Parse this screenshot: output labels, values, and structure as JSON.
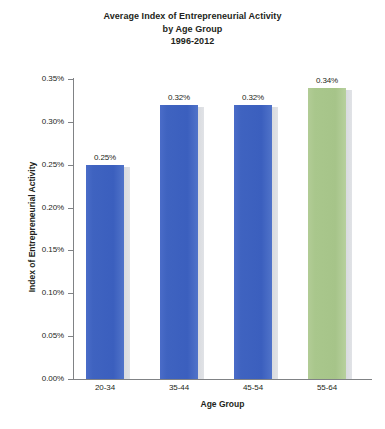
{
  "chart_data": {
    "type": "bar",
    "title": "Average Index of Entrepreneurial Activity by Age Group 1996-2012",
    "title_lines": [
      "Average Index of Entrepreneurial Activity",
      "by Age Group",
      "1996-2012"
    ],
    "xlabel": "Age Group",
    "ylabel": "Index of Entrepreneurial Activity",
    "categories": [
      "20-34",
      "35-44",
      "45-54",
      "55-64"
    ],
    "values": [
      0.25,
      0.32,
      0.32,
      0.34
    ],
    "value_labels": [
      "0.25%",
      "0.32%",
      "0.32%",
      "0.34%"
    ],
    "bar_colors": [
      "#3f63c0",
      "#3f63c0",
      "#3f63c0",
      "#a9c78c"
    ],
    "ylim": [
      0.0,
      0.35
    ],
    "ytick_values": [
      0.0,
      0.05,
      0.1,
      0.15,
      0.2,
      0.25,
      0.3,
      0.35
    ],
    "ytick_labels": [
      "0.00%",
      "0.05%",
      "0.10%",
      "0.15%",
      "0.20%",
      "0.25%",
      "0.30%",
      "0.35%"
    ],
    "grid": false,
    "legend": "none",
    "units": "percent",
    "axis_color": "#808285",
    "text_color": "#231f20",
    "background": "#ffffff"
  }
}
